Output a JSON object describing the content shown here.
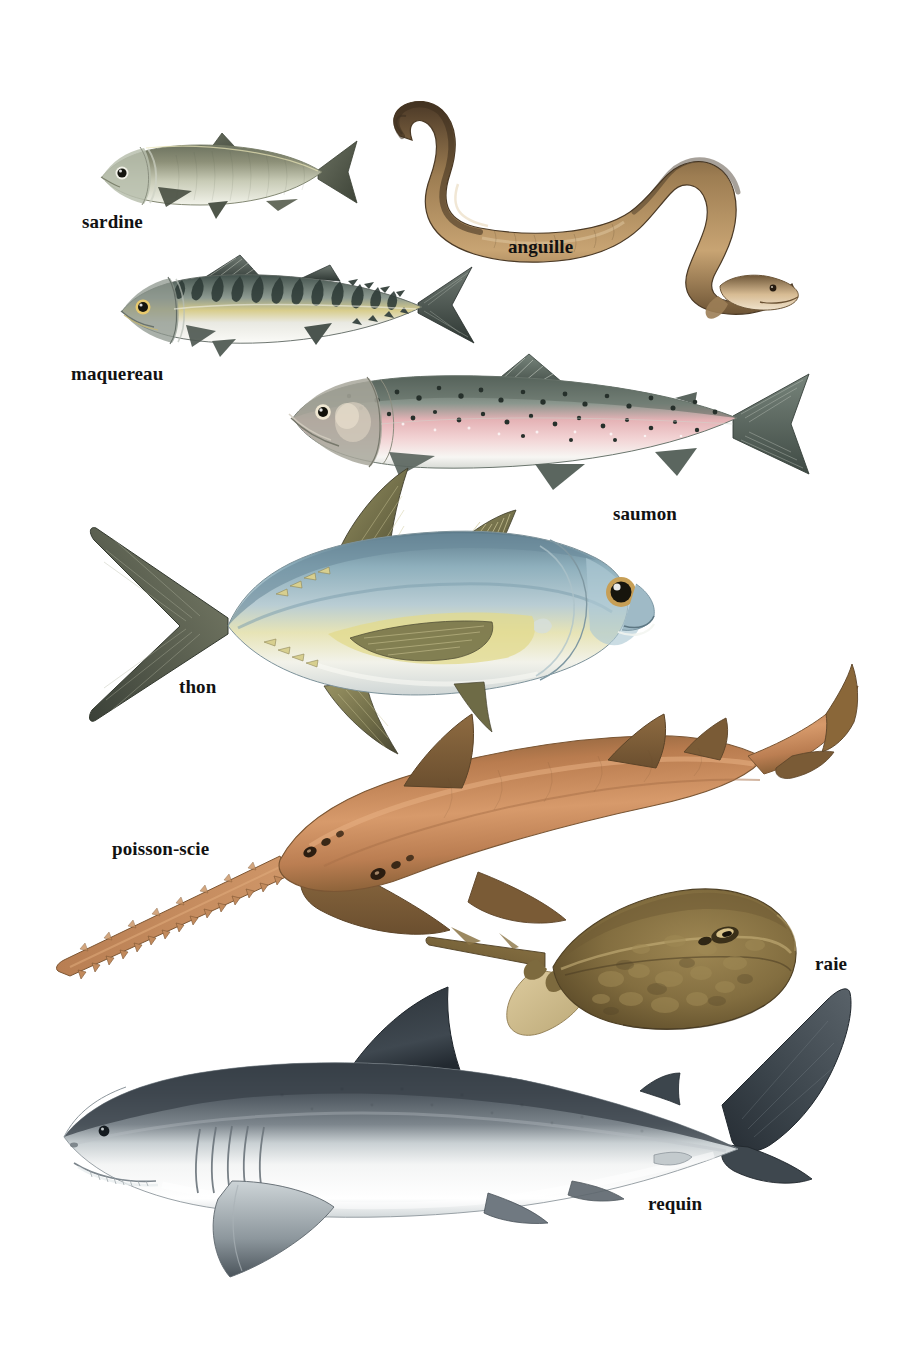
{
  "plate": {
    "title": "Poissons",
    "language": "fr",
    "background_color": "#ffffff",
    "width": 901,
    "height": 1363,
    "label_color": "#121212",
    "label_font_size_px": 19
  },
  "specimens": [
    {
      "id": "sardine",
      "label": "sardine",
      "label_x": 82,
      "label_y": 212,
      "illustration": {
        "x": 96,
        "y": 125,
        "width": 262,
        "height": 95,
        "orientation": "facing-left",
        "body_color": "#8d9078",
        "belly_color": "#eef0e4",
        "back_color": "#5e6350",
        "fin_color": "#4f5547",
        "accent_color": "#c9cbb2"
      }
    },
    {
      "id": "anguille",
      "label": "anguille",
      "label_x": 508,
      "label_y": 237,
      "illustration": {
        "x": 362,
        "y": 88,
        "width": 440,
        "height": 230,
        "orientation": "s-curve-head-right",
        "body_color": "#a57f52",
        "belly_color": "#e2c9a4",
        "back_color": "#4e3b26",
        "fin_color": "#6b5232",
        "accent_color": "#c9a679"
      }
    },
    {
      "id": "maquereau",
      "label": "maquereau",
      "label_x": 71,
      "label_y": 364,
      "illustration": {
        "x": 116,
        "y": 253,
        "width": 362,
        "height": 110,
        "orientation": "facing-left",
        "body_color": "#9aa39a",
        "belly_color": "#f0f1ec",
        "back_color": "#3c4a46",
        "fin_color": "#46514c",
        "accent_color": "#d4c27a"
      }
    },
    {
      "id": "saumon",
      "label": "saumon",
      "label_x": 613,
      "label_y": 504,
      "illustration": {
        "x": 285,
        "y": 352,
        "width": 528,
        "height": 150,
        "orientation": "facing-left",
        "body_color": "#9aa49c",
        "belly_color": "#f4f2ef",
        "back_color": "#5d6b62",
        "fin_color": "#5a6660",
        "accent_color": "#eab5b8"
      }
    },
    {
      "id": "thon",
      "label": "thon",
      "label_x": 179,
      "label_y": 677,
      "illustration": {
        "x": 88,
        "y": 466,
        "width": 567,
        "height": 290,
        "orientation": "facing-right",
        "body_color": "#9fb3bd",
        "belly_color": "#f2f3ee",
        "back_color": "#5f7a87",
        "fin_color": "#6d6a4a",
        "accent_color": "#e8e0a4"
      }
    },
    {
      "id": "poisson-scie",
      "label": "poisson-scie",
      "label_x": 112,
      "label_y": 839,
      "illustration": {
        "x": 48,
        "y": 660,
        "width": 810,
        "height": 330,
        "orientation": "facing-lower-left",
        "body_color": "#bd7f55",
        "belly_color": "#e3b68c",
        "back_color": "#6d5437",
        "fin_color": "#8a7049",
        "accent_color": "#c98f62"
      }
    },
    {
      "id": "raie",
      "label": "raie",
      "label_x": 815,
      "label_y": 954,
      "illustration": {
        "x": 430,
        "y": 880,
        "width": 370,
        "height": 180,
        "orientation": "diamond-head-right",
        "body_color": "#8a7548",
        "belly_color": "#d9c79a",
        "back_color": "#5b4b2c",
        "fin_color": "#7a6740",
        "accent_color": "#a2884f"
      }
    },
    {
      "id": "requin",
      "label": "requin",
      "label_x": 648,
      "label_y": 1194,
      "illustration": {
        "x": 42,
        "y": 985,
        "width": 828,
        "height": 312,
        "orientation": "facing-left",
        "body_color": "#6f7880",
        "belly_color": "#f3f4f4",
        "back_color": "#2f363c",
        "fin_color": "#3b444b",
        "accent_color": "#9aa3a9"
      }
    }
  ]
}
